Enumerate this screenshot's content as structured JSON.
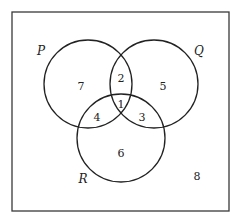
{
  "diagram": {
    "type": "venn",
    "universe": {
      "x": 12,
      "y": 12,
      "width": 217,
      "height": 199,
      "outside_value": "8"
    },
    "sets": [
      {
        "id": "P",
        "label": "P",
        "cx": 88,
        "cy": 84,
        "r": 44
      },
      {
        "id": "Q",
        "label": "Q",
        "cx": 154,
        "cy": 84,
        "r": 44
      },
      {
        "id": "R",
        "label": "R",
        "cx": 121,
        "cy": 138,
        "r": 44
      }
    ],
    "regions": {
      "P_only": "7",
      "Q_only": "5",
      "R_only": "6",
      "P_and_Q_only": "2",
      "P_and_R_only": "4",
      "Q_and_R_only": "3",
      "P_and_Q_and_R": "1",
      "outside": "8"
    },
    "colors": {
      "stroke": "#222222",
      "border": "#3a3a3a",
      "background": "#ffffff"
    }
  }
}
